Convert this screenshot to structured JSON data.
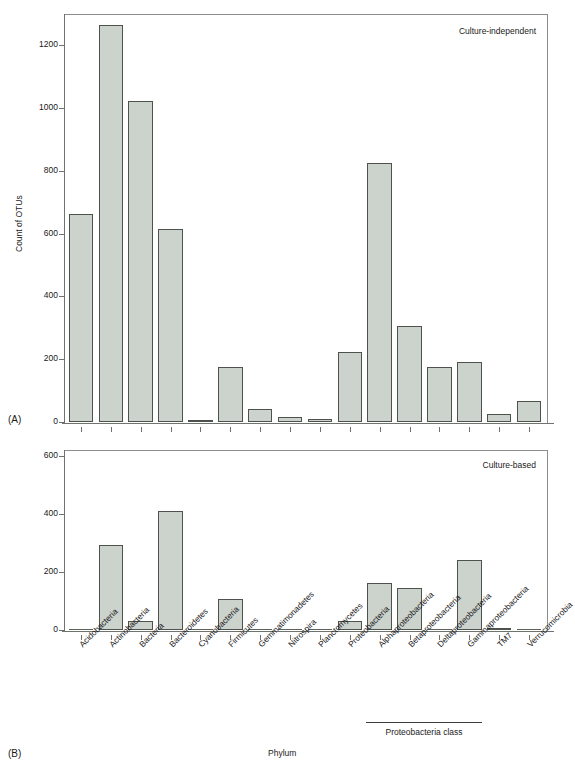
{
  "figure": {
    "panel_a_letter": "(A)",
    "panel_b_letter": "(B)",
    "x_axis_title": "Phylum",
    "group_bracket_label": "Proteobacteria class"
  },
  "chart_data": [
    {
      "type": "bar",
      "panel": "A",
      "title": "Culture-independent",
      "xlabel": "Phylum",
      "ylabel": "Count of OTUs",
      "ylim": [
        0,
        1300
      ],
      "yticks": [
        0,
        200,
        400,
        600,
        800,
        1000,
        1200
      ],
      "ytick_labels": [
        "0",
        "200",
        "400",
        "600",
        "800",
        "1000",
        "1200"
      ],
      "grid": false,
      "bar_color": "#ccd2cc",
      "bar_edge_color": "#4d524d",
      "categories": [
        "Acidobacteria",
        "Actinobacteria",
        "Bacteria",
        "Bacteroidetes",
        "Cyanobacteria",
        "Firmicutes",
        "Gemmatimonadetes",
        "Nitrospira",
        "Planctomycetes",
        "Proteobacteria",
        "Alphaproteobacteria",
        "Betaproteobacteria",
        "Deltaproteobacteria",
        "Gammaproteobacteria",
        "TM7",
        "Verrucomicrobia"
      ],
      "values": [
        663,
        1265,
        1022,
        615,
        8,
        175,
        42,
        15,
        10,
        222,
        825,
        305,
        175,
        192,
        27,
        68
      ]
    },
    {
      "type": "bar",
      "panel": "B",
      "title": "Culture-based",
      "xlabel": "Phylum",
      "ylabel": "",
      "ylim": [
        0,
        620
      ],
      "yticks": [
        0,
        200,
        400,
        600
      ],
      "ytick_labels": [
        "0",
        "200",
        "400",
        "600"
      ],
      "grid": false,
      "bar_color": "#ccd2cc",
      "bar_edge_color": "#4d524d",
      "categories": [
        "Acidobacteria",
        "Actinobacteria",
        "Bacteria",
        "Bacteroidetes",
        "Cyanobacteria",
        "Firmicutes",
        "Gemmatimonadetes",
        "Nitrospira",
        "Planctomycetes",
        "Proteobacteria",
        "Alphaproteobacteria",
        "Betaproteobacteria",
        "Deltaproteobacteria",
        "Gammaproteobacteria",
        "TM7",
        "Verrucomicrobia"
      ],
      "values": [
        0,
        292,
        32,
        411,
        0,
        108,
        0,
        0,
        0,
        32,
        163,
        146,
        0,
        240,
        6,
        0
      ]
    }
  ],
  "group_bracket": {
    "label": "Proteobacteria class",
    "from_category": "Alphaproteobacteria",
    "to_category": "Gammaproteobacteria"
  }
}
